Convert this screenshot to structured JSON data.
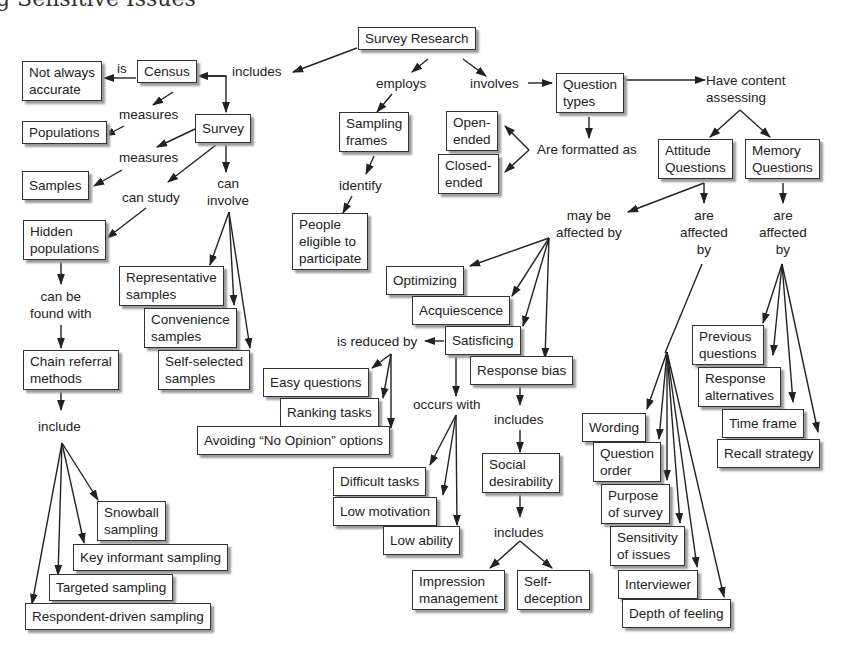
{
  "title": "g Sensitive Issues",
  "nodes": {
    "survey_research": "Survey Research",
    "census": "Census",
    "not_always_accurate": "Not always\naccurate",
    "populations": "Populations",
    "survey": "Survey",
    "samples": "Samples",
    "hidden_populations": "Hidden\npopulations",
    "chain_referral": "Chain referral\nmethods",
    "snowball": "Snowball\nsampling",
    "key_informant": "Key informant sampling",
    "targeted": "Targeted sampling",
    "respondent_driven": "Respondent-driven sampling",
    "representative": "Representative\nsamples",
    "convenience": "Convenience\nsamples",
    "self_selected": "Self-selected\nsamples",
    "sampling_frames": "Sampling\nframes",
    "people_eligible": "People\neligible to\nparticipate",
    "question_types": "Question\ntypes",
    "open_ended": "Open-\nended",
    "closed_ended": "Closed-\nended",
    "attitude_questions": "Attitude\nQuestions",
    "memory_questions": "Memory\nQuestions",
    "optimizing": "Optimizing",
    "acquiescence": "Acquiescence",
    "satisficing": "Satisficing",
    "response_bias": "Response bias",
    "easy_questions": "Easy questions",
    "ranking_tasks": "Ranking tasks",
    "avoiding_no_opinion": "Avoiding “No Opinion” options",
    "difficult_tasks": "Difficult tasks",
    "low_motivation": "Low motivation",
    "low_ability": "Low ability",
    "social_desirability": "Social\ndesirability",
    "impression_management": "Impression\nmanagement",
    "self_deception": "Self-\ndeception",
    "wording": "Wording",
    "question_order": "Question\norder",
    "purpose_of_survey": "Purpose\nof survey",
    "sensitivity_of_issues": "Sensitivity\nof issues",
    "interviewer": "Interviewer",
    "depth_of_feeling": "Depth of feeling",
    "previous_questions": "Previous\nquestions",
    "response_alternatives": "Response\nalternatives",
    "time_frame": "Time frame",
    "recall_strategy": "Recall strategy"
  },
  "links": {
    "includes": "includes",
    "is": "is",
    "census_measures": "measures",
    "survey_measures": "measures",
    "can_study": "can study",
    "can_involve": "can\ninvolve",
    "can_be_found_with": "can be\nfound with",
    "include": "include",
    "employs": "employs",
    "identify": "identify",
    "involves": "involves",
    "are_formatted_as": "Are formatted as",
    "have_content_assessing": "Have content\nassessing",
    "may_be_affected_by": "may be\naffected by",
    "attitude_affected_by": "are\naffected\nby",
    "memory_affected_by": "are\naffected\nby",
    "is_reduced_by": "is reduced by",
    "occurs_with": "occurs with",
    "rb_includes": "includes",
    "sd_includes": "includes"
  }
}
